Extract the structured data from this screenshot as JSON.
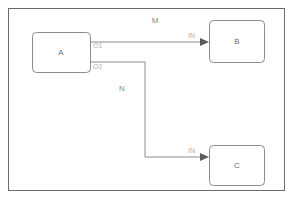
{
  "diagram": {
    "frame": {
      "name": "outer-frame"
    },
    "nodes": [
      {
        "id": "A",
        "label": "A",
        "x": 32,
        "y": 32,
        "w": 58,
        "h": 40
      },
      {
        "id": "B",
        "label": "B",
        "x": 209,
        "y": 20,
        "w": 55,
        "h": 42
      },
      {
        "id": "C",
        "label": "C",
        "x": 209,
        "y": 145,
        "w": 55,
        "h": 40
      }
    ],
    "ports": [
      {
        "id": "A-O1",
        "label": "O1",
        "x": 93,
        "y": 45
      },
      {
        "id": "A-O2",
        "label": "O2",
        "x": 93,
        "y": 66
      },
      {
        "id": "B-IN",
        "label": "IN",
        "x": 188,
        "y": 38
      },
      {
        "id": "C-IN",
        "label": "IN",
        "x": 188,
        "y": 148
      }
    ],
    "edges": [
      {
        "id": "edge-a-to-b",
        "label": "M",
        "from": "A.O1",
        "to": "B.IN",
        "label_x": 155,
        "label_y": 23,
        "path": "M 90 42 L 206 42"
      },
      {
        "id": "edge-a-to-c",
        "label": "N",
        "from": "A.O2",
        "to": "C.IN",
        "label_x": 122,
        "label_y": 91,
        "path": "M 90 62 L 145 62 L 145 157 L 206 157"
      }
    ]
  }
}
